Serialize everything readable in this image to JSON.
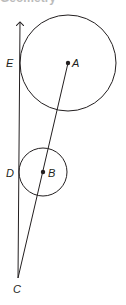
{
  "header": {
    "cropped_text": "Geometry"
  },
  "diagram": {
    "stroke_color": "#231f20",
    "points": [
      {
        "id": "A",
        "label": "A",
        "x": 68,
        "y": 63,
        "label_x": 72,
        "label_y": 67,
        "dot": true
      },
      {
        "id": "B",
        "label": "B",
        "x": 43,
        "y": 172,
        "label_x": 48,
        "label_y": 177,
        "dot": true
      },
      {
        "id": "C",
        "label": "C",
        "x": 18,
        "y": 278,
        "label_x": 13,
        "label_y": 293,
        "dot": false
      },
      {
        "id": "D",
        "label": "D",
        "x": 19,
        "y": 172,
        "label_x": 6,
        "label_y": 177,
        "dot": false
      },
      {
        "id": "E",
        "label": "E",
        "x": 20,
        "y": 63,
        "label_x": 6,
        "label_y": 67,
        "dot": false
      }
    ],
    "circles": [
      {
        "id": "circle-A",
        "cx": 68,
        "cy": 63,
        "r": 48
      },
      {
        "id": "circle-B",
        "cx": 43,
        "cy": 172,
        "r": 24
      }
    ],
    "ray": {
      "from": "C",
      "to_x": 20,
      "to_y": 20
    },
    "segment": {
      "from": "C",
      "to": "A"
    }
  }
}
